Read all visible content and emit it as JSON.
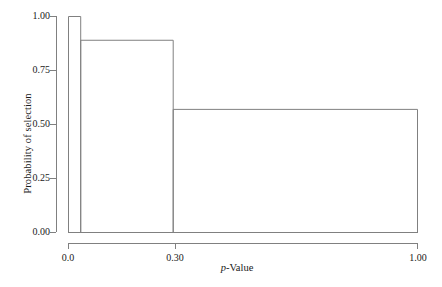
{
  "chart_data": {
    "type": "bar",
    "title": "",
    "subtitle": "",
    "xlabel_prefix": "p",
    "xlabel_suffix": "-Value",
    "xlabel": "p-Value",
    "ylabel": "Probability of selection",
    "xlim": [
      0.0,
      1.0
    ],
    "ylim": [
      0.0,
      1.0
    ],
    "grid": false,
    "legend": null,
    "style": "histogram of unequal-width bins, unfilled outlines",
    "line_color": "#808080",
    "bin_edges": [
      0.0,
      0.035,
      0.3,
      1.0
    ],
    "categories": [
      "0.0-0.035",
      "0.035-0.30",
      "0.30-1.00"
    ],
    "values": [
      1.0,
      0.89,
      0.57
    ],
    "bars": [
      {
        "x_start": 0.0,
        "x_end": 0.035,
        "height": 1.0
      },
      {
        "x_start": 0.035,
        "x_end": 0.3,
        "height": 0.89
      },
      {
        "x_start": 0.3,
        "x_end": 1.0,
        "height": 0.57
      }
    ],
    "xticks": [
      0.0,
      0.3,
      1.0
    ],
    "xticklabels": [
      "0.0",
      "0.30",
      "1.00"
    ],
    "yticks": [
      0.0,
      0.25,
      0.5,
      0.75,
      1.0
    ],
    "yticklabels": [
      "0.00",
      "0.25",
      "0.50",
      "0.75",
      "1.00"
    ]
  },
  "axes": {
    "y": {
      "label": "Probability of selection",
      "ticks": [
        {
          "value": 1.0,
          "label": "1.00"
        },
        {
          "value": 0.75,
          "label": "0.75"
        },
        {
          "value": 0.5,
          "label": "0.50"
        },
        {
          "value": 0.25,
          "label": "0.25"
        },
        {
          "value": 0.0,
          "label": "0.00"
        }
      ]
    },
    "x": {
      "label_italic": "p",
      "label_rest": "-Value",
      "ticks": [
        {
          "value": 0.0,
          "label": "0.0"
        },
        {
          "value": 0.3,
          "label": "0.30"
        },
        {
          "value": 1.0,
          "label": "1.00"
        }
      ]
    }
  }
}
